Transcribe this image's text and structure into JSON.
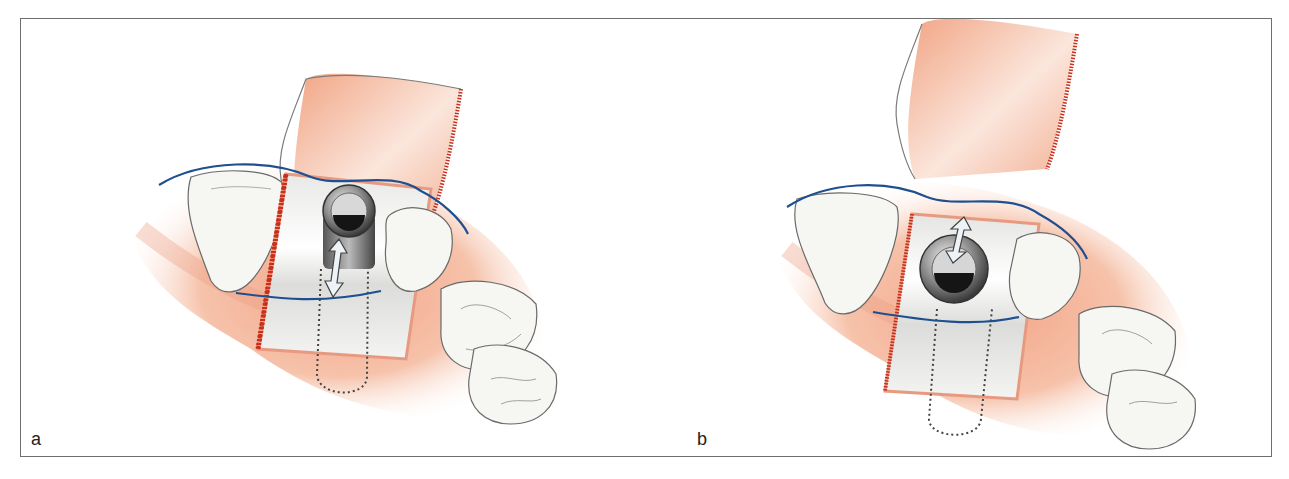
{
  "figure": {
    "panels": [
      {
        "id": "a",
        "label": "a",
        "description": "Implant with cover screw positioned at gingival margin; flap raised, double-headed arrow indicating vertical movement, dotted outline showing pedicle region"
      },
      {
        "id": "b",
        "label": "b",
        "description": "Flap advanced coronally; implant head centered, double-headed arrow above indicating displacement, dotted outline of pedicle below"
      }
    ],
    "colors": {
      "gingiva": "#f2b79a",
      "gingiva_dark": "#e8886a",
      "incision": "#c8301e",
      "suture_line": "#1f4f8f",
      "tooth": "#f4f6f2",
      "tooth_outline": "#6a6a6a",
      "implant_metal": "#8c8c8c",
      "frame": "#6e6e6e",
      "dotted_outline": "#444444"
    }
  }
}
